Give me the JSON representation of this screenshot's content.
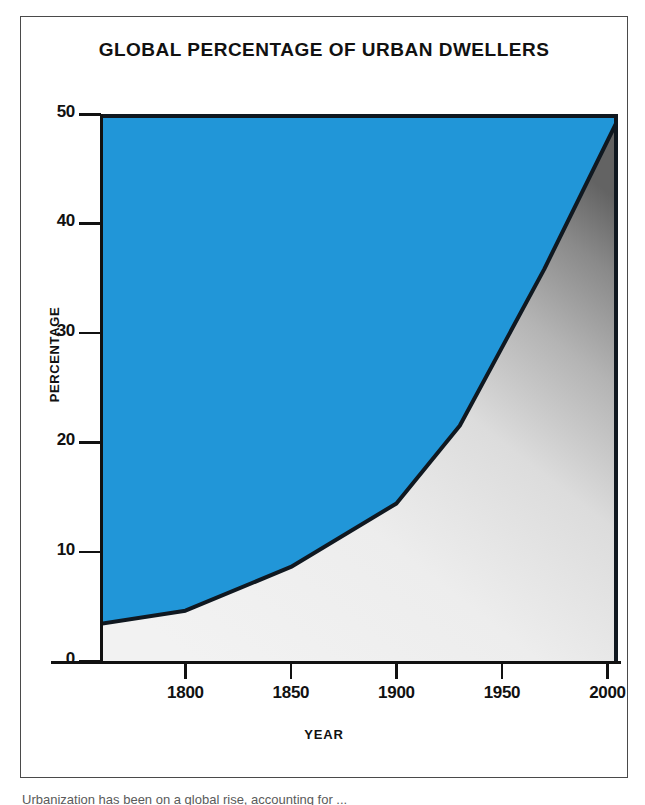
{
  "figure": {
    "title": "GLOBAL PERCENTAGE OF URBAN DWELLERS",
    "caption_partial": "Urbanization has been on a global rise, accounting for ..."
  },
  "colors": {
    "area_upper": "#2196D8",
    "area_lower_light": "#efefef",
    "area_lower_dark": "#6f6f6f",
    "curve": "#101820",
    "axis": "#111111",
    "frame": "#4a4a4a",
    "background": "#ffffff"
  },
  "chart_data": {
    "type": "area",
    "title": "GLOBAL PERCENTAGE OF URBAN DWELLERS",
    "xlabel": "YEAR",
    "ylabel": "PERCENTAGE",
    "xlim": [
      1760,
      2005
    ],
    "ylim": [
      0,
      50
    ],
    "grid": false,
    "legend": null,
    "xticks": [
      1800,
      1850,
      1900,
      1950,
      2000
    ],
    "xtick_labels": [
      "1800",
      "1850",
      "1900",
      "1950",
      "2000"
    ],
    "yticks": [
      0,
      10,
      20,
      30,
      40,
      50
    ],
    "ytick_labels": [
      "0",
      "10",
      "20",
      "30",
      "40",
      "50"
    ],
    "series": [
      {
        "name": "Urban dwellers",
        "x": [
          1760,
          1800,
          1850,
          1900,
          1930,
          1970,
          2005
        ],
        "values": [
          3.4,
          4.6,
          8.6,
          14.4,
          21.5,
          35.8,
          49.5
        ]
      }
    ],
    "shading": {
      "below_curve": "gradient-grey",
      "above_curve": "solid-blue"
    }
  },
  "axis_titles": {
    "y": "PERCENTAGE",
    "x": "YEAR"
  }
}
